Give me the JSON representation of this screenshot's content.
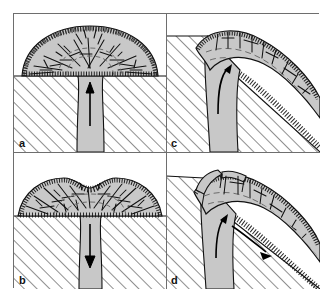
{
  "figure": {
    "panel_count": 4,
    "frame_color": "#6e6e6e",
    "background_color": "#ffffff"
  },
  "legend_colors": {
    "lava_fill": "#c8c8c8",
    "carapace_stipple": "#1a1a1a",
    "basement_hatch": "#222222",
    "outline": "#111111",
    "arrow": "#000000"
  },
  "panels": [
    {
      "id": "a",
      "label": "a",
      "position": "top-left",
      "caption": "Endogenous dome growth: magma rises vertically through the conduit and inflates the dome from within; radial and concentric cracks form in the carapace.",
      "terrain": "flat",
      "arrows": [
        {
          "name": "conduit-up-arrow",
          "direction": "up",
          "label": "magma ascent"
        }
      ],
      "features": [
        "stippled carapace",
        "polygonal cooling cracks",
        "concentric flow bands",
        "flared conduit"
      ]
    },
    {
      "id": "b",
      "label": "b",
      "position": "bottom-left",
      "caption": "Dome subsidence: withdrawal of magma down the conduit lets the broad, flat-topped dome sag and develop a depressed summit.",
      "terrain": "flat",
      "arrows": [
        {
          "name": "conduit-down-arrow",
          "direction": "down",
          "label": "magma withdrawal"
        }
      ],
      "features": [
        "broad flat dome",
        "central summit depression",
        "stippled carapace",
        "polygonal cooling cracks"
      ]
    },
    {
      "id": "c",
      "label": "c",
      "position": "top-right",
      "caption": "Dome growth on a slope: lava emerging from the vertical conduit is deflected and spreads downslope as a thick lobe over the inclined basement.",
      "terrain": "inclined slope",
      "arrows": [
        {
          "name": "curved-flow-arrow",
          "direction": "up-then-downslope",
          "label": "deflected flow"
        }
      ],
      "features": [
        "inclined basement",
        "asymmetric lobe",
        "stippled basal breccia",
        "flow banding"
      ]
    },
    {
      "id": "d",
      "label": "d",
      "position": "bottom-right",
      "caption": "Slope failure of the dome: a block detaches along the upslope margin while lava continues to feed the downslope lobe.",
      "terrain": "inclined slope",
      "arrows": [
        {
          "name": "conduit-up-arrow",
          "direction": "up",
          "label": "magma ascent"
        },
        {
          "name": "downslope-arrow",
          "direction": "downslope",
          "label": "downslope spreading"
        }
      ],
      "features": [
        "detached/slumped block",
        "notched upslope margin",
        "stippled basal breccia",
        "flow banding"
      ]
    }
  ]
}
